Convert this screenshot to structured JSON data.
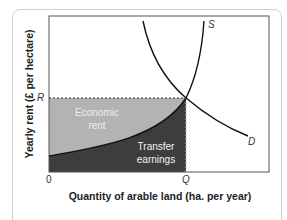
{
  "diagram": {
    "axes": {
      "y_label": "Yearly rent (£ per hectare)",
      "x_label": "Quantity of arable land (ha. per year)",
      "origin_label": "0",
      "y_tick": "R",
      "x_tick": "Q"
    },
    "curves": {
      "supply_label": "S",
      "demand_label": "D"
    },
    "regions": {
      "economic_rent": {
        "line1": "Economic",
        "line2": "rent",
        "color": "#b3b3b3",
        "text_color": "#eeeeee"
      },
      "transfer_earnings": {
        "line1": "Transfer",
        "line2": "earnings",
        "color": "#3d3d3d",
        "text_color": "#f2f2f2"
      }
    },
    "colors": {
      "frame": "#555555",
      "curve": "#111111",
      "card_border": "#cfcfcf"
    }
  }
}
